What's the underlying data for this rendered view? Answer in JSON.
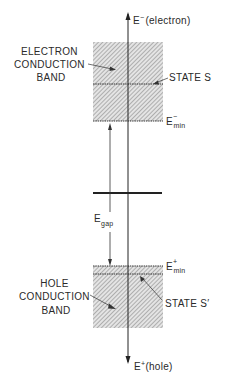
{
  "diagram": {
    "axis_top_label": {
      "main": "E",
      "sup": "−",
      "rest": "(electron)"
    },
    "axis_bottom_label": {
      "main": "E",
      "sup": "+",
      "rest": "(hole)"
    },
    "electron_band_label": [
      "ELECTRON",
      "CONDUCTION",
      "BAND"
    ],
    "hole_band_label": [
      "HOLE",
      "CONDUCTION",
      "BAND"
    ],
    "state_s_label": "STATE  S",
    "state_s_prime_label": "STATE  S′",
    "e_min_minus": {
      "main": "E",
      "sup": "−",
      "sub": "min"
    },
    "e_min_plus": {
      "main": "E",
      "sup": "+",
      "sub": "min"
    },
    "e_gap": {
      "main": "E",
      "sub": "gap"
    }
  }
}
